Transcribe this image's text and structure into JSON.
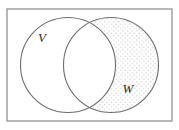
{
  "figure": {
    "name": "venn-diagram-two-sets",
    "background_color": "#ffffff",
    "universe_rectangle": {
      "name": "universal-set-rectangle",
      "x": 7,
      "y": 9,
      "width": 165,
      "height": 112,
      "stroke_color": "#9a9a9a",
      "stroke_width": 1.4,
      "fill": "none",
      "label": ""
    },
    "circles": [
      {
        "name": "set-v-circle",
        "set_label": "V",
        "cx": 68,
        "cy": 65,
        "r": 47.5,
        "stroke_color": "#6e6e6e",
        "stroke_width": 1.1,
        "fill": "none",
        "shaded": false
      },
      {
        "name": "set-w-circle",
        "set_label": "W",
        "cx": 111,
        "cy": 65,
        "r": 47.5,
        "stroke_color": "#6e6e6e",
        "stroke_width": 1.1,
        "fill": "none",
        "shaded": true
      }
    ],
    "labels": [
      {
        "name": "set-label-v",
        "text": "V",
        "x": 42,
        "y": 42,
        "style": "italic-serif",
        "color": "#2b2b2b",
        "font_size": 13
      },
      {
        "name": "set-label-w",
        "text": "W",
        "x": 128,
        "y": 93,
        "style": "italic-serif",
        "color": "#2b2b2b",
        "font_size": 13
      }
    ],
    "shading": {
      "name": "dot-stipple-shading",
      "region": "W minus V",
      "pattern": "dots",
      "dot_color": "#c9c9c9",
      "dot_radius": 0.65,
      "spacing": 4.6,
      "description": "Light gray dot grid filling the portion of circle W that lies outside circle V; the lens-shaped intersection is left unshaded."
    }
  }
}
